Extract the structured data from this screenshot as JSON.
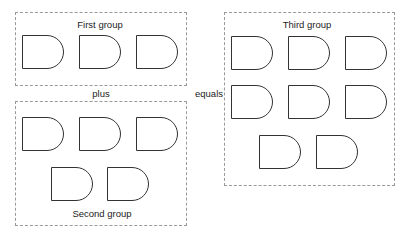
{
  "diagram": {
    "operators": {
      "plus": "plus",
      "equals": "equals"
    },
    "groups": [
      {
        "id": "first",
        "title": "First group",
        "box": {
          "x": 15,
          "y": 12,
          "w": 172,
          "h": 74
        },
        "title_pos": {
          "x": 100,
          "y": 19
        },
        "items": [
          {
            "x": 22,
            "y": 35
          },
          {
            "x": 79,
            "y": 35
          },
          {
            "x": 136,
            "y": 35
          }
        ]
      },
      {
        "id": "second",
        "title": "Second group",
        "box": {
          "x": 15,
          "y": 101,
          "w": 172,
          "h": 125
        },
        "title_pos": {
          "x": 102,
          "y": 208
        },
        "items": [
          {
            "x": 22,
            "y": 117
          },
          {
            "x": 79,
            "y": 117
          },
          {
            "x": 136,
            "y": 117
          },
          {
            "x": 51,
            "y": 167
          },
          {
            "x": 107,
            "y": 167
          }
        ]
      },
      {
        "id": "third",
        "title": "Third group",
        "box": {
          "x": 224,
          "y": 12,
          "w": 171,
          "h": 174
        },
        "title_pos": {
          "x": 307,
          "y": 19
        },
        "items": [
          {
            "x": 231,
            "y": 36
          },
          {
            "x": 288,
            "y": 36
          },
          {
            "x": 345,
            "y": 36
          },
          {
            "x": 231,
            "y": 85
          },
          {
            "x": 288,
            "y": 85
          },
          {
            "x": 345,
            "y": 85
          },
          {
            "x": 259,
            "y": 135
          },
          {
            "x": 316,
            "y": 135
          }
        ]
      }
    ],
    "counts": {
      "first": 3,
      "second": 5,
      "third": 8
    }
  }
}
